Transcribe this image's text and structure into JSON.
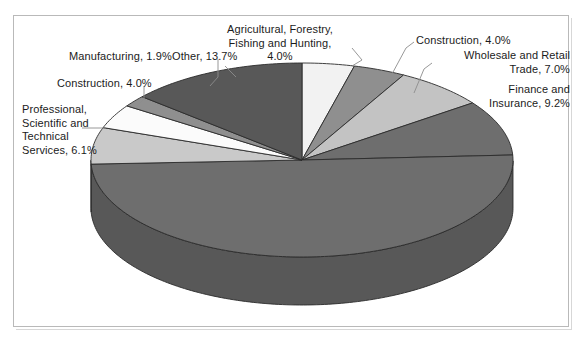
{
  "chart_data": {
    "type": "pie",
    "title": "",
    "subtitle": "",
    "xlabel": "",
    "ylabel": "",
    "legend_position": "none",
    "grid": false,
    "three_d": true,
    "labels_show_percent": true,
    "categories": [
      "Agricultural, Forestry, Fishing and Hunting",
      "Construction",
      "Wholesale and Retail Trade",
      "Finance and Insurance",
      "Unlabeled major segment",
      "Professional, Scientific and Technical Services",
      "Construction",
      "Manufacturing",
      "Other"
    ],
    "values": [
      4.0,
      4.0,
      7.0,
      9.2,
      50.2,
      6.1,
      4.0,
      1.9,
      13.7
    ],
    "value_unit": "%",
    "slices": [
      {
        "name": "Agricultural, Forestry, Fishing and Hunting",
        "value": 4.0,
        "color": "#f2f2f2",
        "label_text": "Agricultural, Forestry,\nFishing and Hunting,\n4.0%"
      },
      {
        "name": "Construction",
        "value": 4.0,
        "color": "#8f8f8f",
        "label_text": "Construction, 4.0%"
      },
      {
        "name": "Wholesale and Retail Trade",
        "value": 7.0,
        "color": "#c3c3c3",
        "label_text": "Wholesale and Retail\nTrade, 7.0%"
      },
      {
        "name": "Finance and Insurance",
        "value": 9.2,
        "color": "#6e6e6e",
        "label_text": "Finance and\nInsurance, 9.2%"
      },
      {
        "name": "Unlabeled major segment",
        "value": 50.2,
        "color": "#6e6e6e",
        "label_text": ""
      },
      {
        "name": "Professional, Scientific and Technical Services",
        "value": 6.1,
        "color": "#c9c9c9",
        "label_text": "Professional,\nScientific and\nTechnical\nServices, 6.1%"
      },
      {
        "name": "Construction",
        "value": 4.0,
        "color": "#fbfbfb",
        "label_text": "Construction, 4.0%"
      },
      {
        "name": "Manufacturing",
        "value": 1.9,
        "color": "#8f8f8f",
        "label_text": "Manufacturing, 1.9%"
      },
      {
        "name": "Other",
        "value": 13.7,
        "color": "#585858",
        "label_text": "Other, 13.7%"
      }
    ],
    "colors": {
      "frame_border": "#b9b9b9",
      "background": "#ffffff",
      "slice_outline": "#2b2b2b",
      "leader_line": "#8c8c8c",
      "text": "#1b1b1b"
    }
  },
  "labels": {
    "agricultural": "Agricultural, Forestry,\nFishing and Hunting,\n4.0%",
    "construction_right": "Construction, 4.0%",
    "wholesale": "Wholesale and Retail\nTrade, 7.0%",
    "finance": "Finance and\nInsurance, 9.2%",
    "professional": "Professional,\nScientific and\nTechnical\nServices, 6.1%",
    "construction_left": "Construction, 4.0%",
    "manufacturing": "Manufacturing, 1.9%",
    "other": "Other, 13.7%"
  }
}
